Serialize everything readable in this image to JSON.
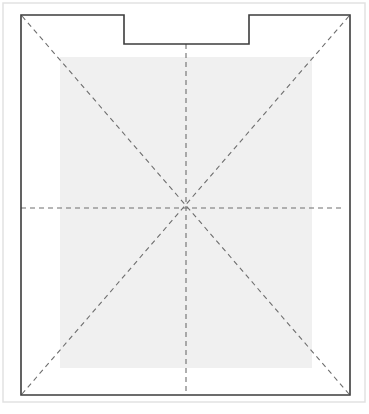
{
  "canvas": {
    "width": 369,
    "height": 414,
    "background_color": "#ffffff",
    "title": "Notched Rectangle Layout Diagram"
  },
  "page_frame": {
    "name": "page-frame",
    "x": 3,
    "y": 3,
    "width": 362,
    "height": 399,
    "stroke_color": "#e2e2e2",
    "stroke_width": 1.5,
    "fill": "none"
  },
  "outline": {
    "name": "notched-rectangle-outline",
    "left": 21,
    "top": 15,
    "right": 350,
    "bottom": 395,
    "stroke_color": "#3c3c3c",
    "stroke_width": 1.6,
    "fill": "none",
    "notch": {
      "name": "top-notch",
      "left": 124,
      "right": 249,
      "top": 15,
      "depth_bottom": 44
    },
    "path": "M 21 15 L 124 15 L 124 44 L 249 44 L 249 15 L 350 15 L 350 395 L 21 395 Z"
  },
  "shaded_region": {
    "name": "shaded-inner-region",
    "x": 60,
    "y": 57,
    "width": 252,
    "height": 311,
    "fill_color": "#f0f0f0",
    "stroke": "none"
  },
  "center_point": {
    "name": "center-point",
    "x": 186,
    "y": 208
  },
  "guides": {
    "stroke_color": "#6e6e6e",
    "stroke_width": 1.1,
    "dash_pattern": "5 4",
    "lines": [
      {
        "name": "guide-vertical-center",
        "orientation": "vertical",
        "x1": 186,
        "y1": 44,
        "x2": 186,
        "y2": 395
      },
      {
        "name": "guide-horizontal-center",
        "orientation": "horizontal",
        "x1": 21,
        "y1": 208,
        "x2": 345,
        "y2": 208
      },
      {
        "name": "guide-diagonal-tl-br",
        "orientation": "diagonal",
        "x1": 22,
        "y1": 16,
        "x2": 349,
        "y2": 394
      },
      {
        "name": "guide-diagonal-tr-bl",
        "orientation": "diagonal",
        "x1": 349,
        "y1": 16,
        "x2": 22,
        "y2": 394
      }
    ]
  }
}
